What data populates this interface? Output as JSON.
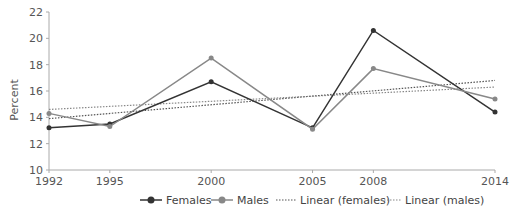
{
  "chart_data": {
    "type": "line",
    "title": "",
    "xlabel": "",
    "ylabel": "Percent",
    "x": [
      1992,
      1995,
      2000,
      2005,
      2008,
      2014
    ],
    "x_tick_labels": [
      "1992",
      "1995",
      "2000",
      "2005",
      "2008",
      "2014"
    ],
    "ylim": [
      10,
      22
    ],
    "y_ticks": [
      10,
      12,
      14,
      16,
      18,
      20,
      22
    ],
    "grid": false,
    "legend_position": "bottom",
    "series": [
      {
        "name": "Females",
        "style": "solid-marker",
        "color": "#333333",
        "values": [
          13.2,
          13.5,
          16.7,
          13.2,
          20.6,
          14.4
        ]
      },
      {
        "name": "Males",
        "style": "solid-marker",
        "color": "#888888",
        "values": [
          14.3,
          13.3,
          18.5,
          13.1,
          17.7,
          15.4
        ]
      },
      {
        "name": "Linear (females)",
        "style": "dotted",
        "color": "#555555",
        "trend_from": 13.9,
        "trend_to": 16.8
      },
      {
        "name": "Linear (males)",
        "style": "dotted",
        "color": "#888888",
        "trend_from": 14.6,
        "trend_to": 16.3
      }
    ]
  },
  "legend": {
    "females": "Females",
    "males": "Males",
    "linear_females": "Linear (females)",
    "linear_males": "Linear (males)"
  }
}
